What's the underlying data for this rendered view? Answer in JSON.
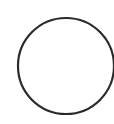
{
  "shape": {
    "type": "circle",
    "stroke_color": "#2a2a2a",
    "fill_color": "#ffffff",
    "cx": 66,
    "cy": 66,
    "r": 48,
    "stroke_width": 2.2
  }
}
